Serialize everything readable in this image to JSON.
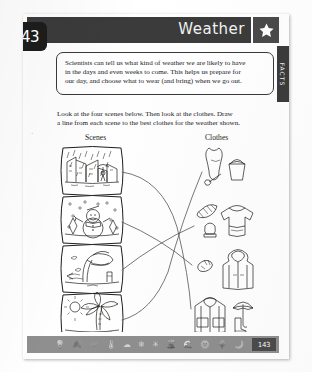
{
  "page": {
    "tab_number": "43",
    "footer_page_number": "143",
    "side_tab_label": "FACTS"
  },
  "header": {
    "title": "Weather",
    "star_icon": "star-icon"
  },
  "facts": {
    "lines": [
      "Scientists can tell us what kind of weather we are likely to have",
      "in the days and even weeks to come. This helps us prepare for",
      "our day, and choose what to wear (and bring) when we go out."
    ]
  },
  "instructions": {
    "lines": [
      "Look at the four scenes below. Then look at the clothes. Draw",
      "a line from each scene to the best clothes for the weather shown."
    ]
  },
  "columns": {
    "left_label": "Scenes",
    "right_label": "Clothes"
  },
  "scenes": [
    {
      "id": "scene-rain",
      "name": "rainy-street-scene",
      "alt": "Rainy city street with person under umbrella"
    },
    {
      "id": "scene-snow",
      "name": "snowman-scene",
      "alt": "Snowy field with snowman and falling snow"
    },
    {
      "id": "scene-wind",
      "name": "windy-tree-scene",
      "alt": "Windy day with tree bending in the wind"
    },
    {
      "id": "scene-sun",
      "name": "sunny-palm-scene",
      "alt": "Sunny beach with palm tree and bright sun"
    }
  ],
  "clothes": [
    {
      "id": "clothes-swim",
      "name": "swimsuit-bucket-spade",
      "alt": "Swimsuit with bucket and spade"
    },
    {
      "id": "clothes-warm",
      "name": "scarf-hat-sweater",
      "alt": "Striped scarf, woolly hat and sweater"
    },
    {
      "id": "clothes-jacket",
      "name": "gloves-hooded-jacket",
      "alt": "Gloves and hooded winter jacket"
    },
    {
      "id": "clothes-rain",
      "name": "raincoat-umbrella-boots",
      "alt": "Raincoat with umbrella and rain boots"
    }
  ],
  "connections": [
    {
      "from": "scene-rain",
      "to": "clothes-rain"
    },
    {
      "from": "scene-snow",
      "to": "clothes-jacket"
    },
    {
      "from": "scene-wind",
      "to": "clothes-warm"
    },
    {
      "from": "scene-sun",
      "to": "clothes-swim"
    }
  ],
  "footer": {
    "icons": [
      "lightbulb-icon",
      "leaf-icon",
      "bird-icon",
      "thermometer-icon",
      "cloud-icon",
      "snowflake-icon",
      "sun-icon",
      "volcano-icon",
      "wave-icon",
      "planet-icon",
      "tree-icon",
      "moon-icon"
    ]
  }
}
